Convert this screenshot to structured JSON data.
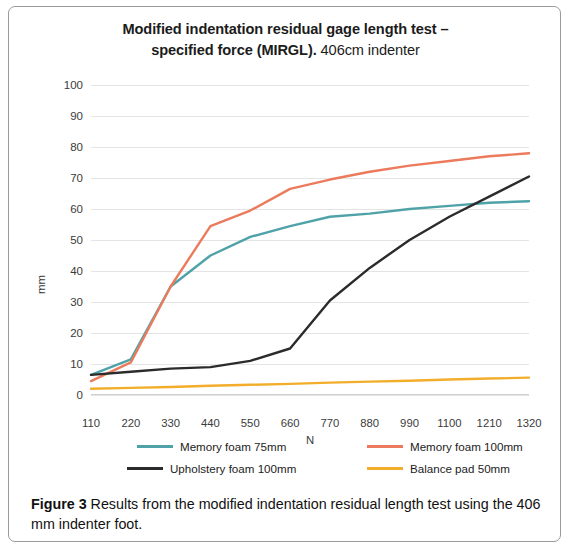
{
  "figure": {
    "title_line1": "Modified indentation residual gage length test –",
    "title_line2_bold": "specified force (MIRGL).",
    "title_line2_light": " 406cm indenter",
    "caption_label": "Figure 3",
    "caption_text": " Results from the modified indentation residual length test using the 406 mm indenter foot."
  },
  "chart_data": {
    "type": "line",
    "title": "Modified indentation residual gage length test – specified force (MIRGL). 406cm indenter",
    "xlabel": "N",
    "ylabel": "mm",
    "xlim": [
      110,
      1320
    ],
    "ylim": [
      0,
      100
    ],
    "grid": true,
    "legend_position": "bottom",
    "x": [
      110,
      220,
      330,
      440,
      550,
      660,
      770,
      880,
      990,
      1100,
      1210,
      1320
    ],
    "xticks": [
      "110",
      "220",
      "330",
      "440",
      "550",
      "660",
      "770",
      "880",
      "990",
      "1100",
      "1210",
      "1320"
    ],
    "yticks": [
      "0",
      "10",
      "20",
      "30",
      "40",
      "50",
      "60",
      "70",
      "80",
      "90",
      "100"
    ],
    "series": [
      {
        "name": "Memory foam 75mm",
        "color": "#4FA3A8",
        "values": [
          6.5,
          11.5,
          35.0,
          45.0,
          51.0,
          54.5,
          57.5,
          58.5,
          60.0,
          61.0,
          62.0,
          62.5
        ]
      },
      {
        "name": "Memory foam 100mm",
        "color": "#EB7B5C",
        "values": [
          4.5,
          10.5,
          35.0,
          54.5,
          59.5,
          66.5,
          69.5,
          72.0,
          74.0,
          75.5,
          77.0,
          78.0
        ]
      },
      {
        "name": "Upholstery foam 100mm",
        "color": "#2B2B2B",
        "values": [
          6.5,
          7.5,
          8.5,
          9.0,
          11.0,
          15.0,
          30.5,
          41.0,
          50.0,
          57.5,
          64.0,
          70.5
        ]
      },
      {
        "name": "Balance pad 50mm",
        "color": "#F2AE2B",
        "values": [
          2.0,
          2.3,
          2.6,
          3.0,
          3.3,
          3.6,
          4.0,
          4.3,
          4.6,
          5.0,
          5.3,
          5.6
        ]
      }
    ]
  }
}
